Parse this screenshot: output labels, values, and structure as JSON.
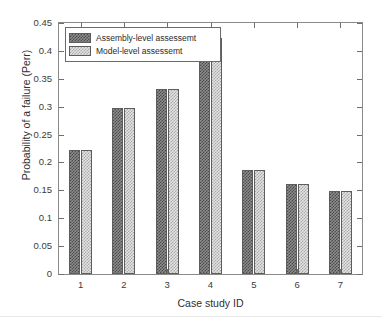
{
  "chart_data": {
    "type": "bar",
    "title": "",
    "subtitle": "",
    "xlabel": "Case study ID",
    "ylabel": "Probability of a failure (Perr)",
    "categories": [
      "1",
      "2",
      "3",
      "4",
      "5",
      "6",
      "7"
    ],
    "series": [
      {
        "name": "Assembly-level assessemt",
        "values": [
          0.222,
          0.297,
          0.331,
          0.423,
          0.187,
          0.161,
          0.149
        ],
        "pattern": "dark-checker",
        "color": "#6a6a6a"
      },
      {
        "name": "Model-level assessemt",
        "values": [
          0.222,
          0.297,
          0.331,
          0.423,
          0.187,
          0.161,
          0.149
        ],
        "pattern": "light-checker",
        "color": "#d6d6d6"
      }
    ],
    "ylim": [
      0,
      0.45
    ],
    "yticks": [
      "0",
      "0.05",
      "0.1",
      "0.15",
      "0.2",
      "0.25",
      "0.3",
      "0.35",
      "0.4",
      "0.45"
    ],
    "ytick_values": [
      0,
      0.05,
      0.1,
      0.15,
      0.2,
      0.25,
      0.3,
      0.35,
      0.4,
      0.45
    ],
    "xticks": [
      "1",
      "2",
      "3",
      "4",
      "5",
      "6",
      "7"
    ],
    "grid": false,
    "legend_position": "top-left-inside",
    "axis_color": "#8a8a8a",
    "background": "#ffffff"
  },
  "legend": {
    "items": [
      {
        "label": "Assembly-level assessemt"
      },
      {
        "label": "Model-level assessemt"
      }
    ]
  }
}
